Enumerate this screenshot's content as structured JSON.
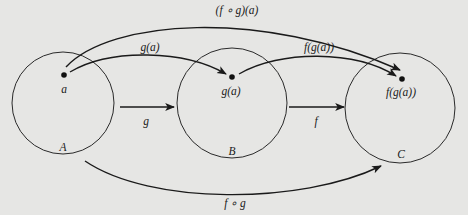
{
  "figure": {
    "sets": [
      {
        "id": "A",
        "label": "A",
        "element_label": "a"
      },
      {
        "id": "B",
        "label": "B",
        "element_label": "g(a)"
      },
      {
        "id": "C",
        "label": "C",
        "element_label": "f(g(a))"
      }
    ],
    "maps": {
      "g_label": "g",
      "f_label": "f",
      "composition_label": "f ∘ g",
      "curve_g_of_a_label": "g(a)",
      "curve_f_of_g_of_a_label": "f(g(a))",
      "curve_composition_of_a_label": "(f ∘ g)(a)"
    },
    "colors": {
      "ink": "#1a1a1a",
      "background": "#e6e6e4"
    }
  }
}
